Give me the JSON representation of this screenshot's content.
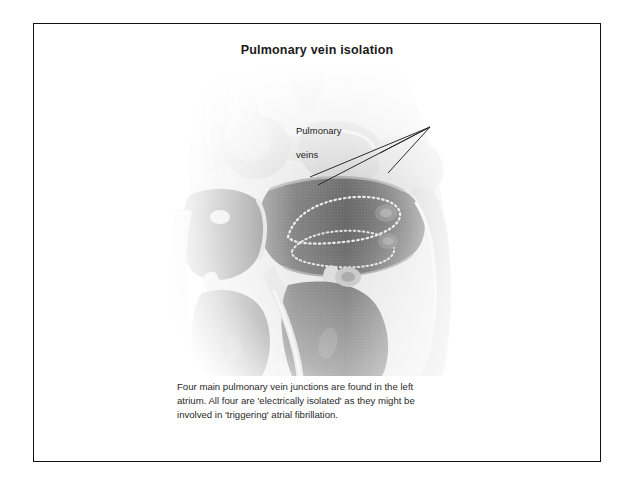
{
  "slide": {
    "title": "Pulmonary vein isolation",
    "annotation": {
      "label": "Pulmonary\nveins",
      "line1": "Pulmonary",
      "line2": "veins"
    },
    "caption": {
      "line1": "Four main pulmonary vein junctions are found in the left",
      "line2": "atrium. All four are 'electrically isolated' as they might be",
      "line3": "involved in 'triggering' atrial fibrillation.",
      "full": "Four main pulmonary vein junctions are found in the left atrium. All four are 'electrically isolated' as they might be involved in 'triggering' atrial fibrillation."
    },
    "figure": {
      "description": "Greyscale anatomical cross-section of the heart showing the left atrium with encircling ablation lines around the pulmonary vein junctions",
      "alt_name": "heart-cross-section-illustration"
    },
    "colors": {
      "border": "#111111",
      "background": "#ffffff",
      "title_text": "#1a1a1a",
      "caption_text": "#2a2a2a",
      "tissue_light": "#d8d8d8",
      "tissue_mid": "#a9a9a9",
      "chamber_dark": "#4a4a4a",
      "chamber_mid": "#6e6e6e",
      "highlight": "#efefef",
      "leader_line": "#2b2b2b"
    }
  }
}
